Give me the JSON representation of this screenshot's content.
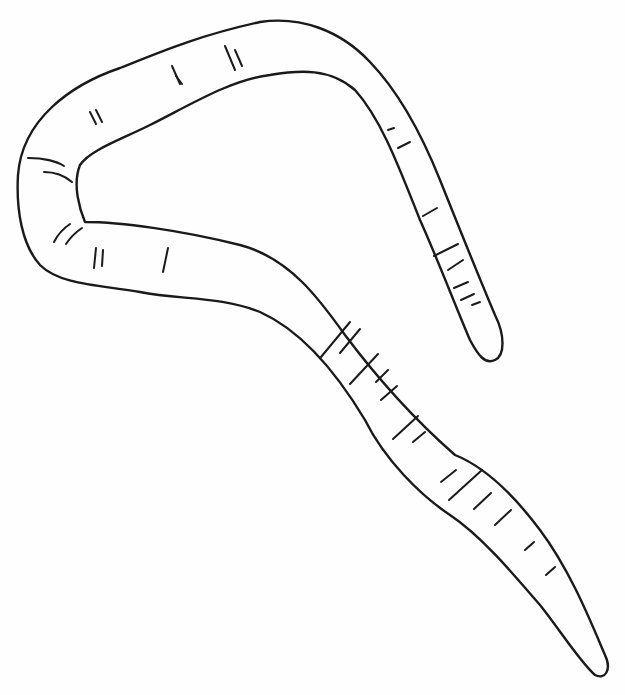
{
  "illustration": {
    "subject": "worm-line-drawing",
    "caption": "",
    "stroke_color": "#1a1a1a",
    "background_color": "#fefefe"
  }
}
